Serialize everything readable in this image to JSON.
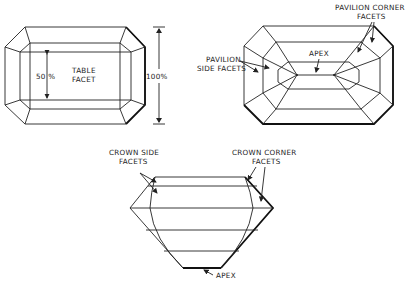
{
  "figure": {
    "top_view_table": {
      "table_label_line1": "TABLE",
      "table_label_line2": "FACET",
      "table_width_label": "50 %",
      "total_width_label": "100%"
    },
    "top_view_pavilion": {
      "pavilion_side_line1": "PAVILION",
      "pavilion_side_line2": "SIDE FACETS",
      "pavilion_corner_line1": "PAVILION CORNER",
      "pavilion_corner_line2": "FACETS",
      "apex_label": "APEX"
    },
    "side_view": {
      "crown_side_line1": "CROWN SIDE",
      "crown_side_line2": "FACETS",
      "crown_corner_line1": "CROWN CORNER",
      "crown_corner_line2": "FACETS",
      "apex_label": "APEX"
    }
  }
}
